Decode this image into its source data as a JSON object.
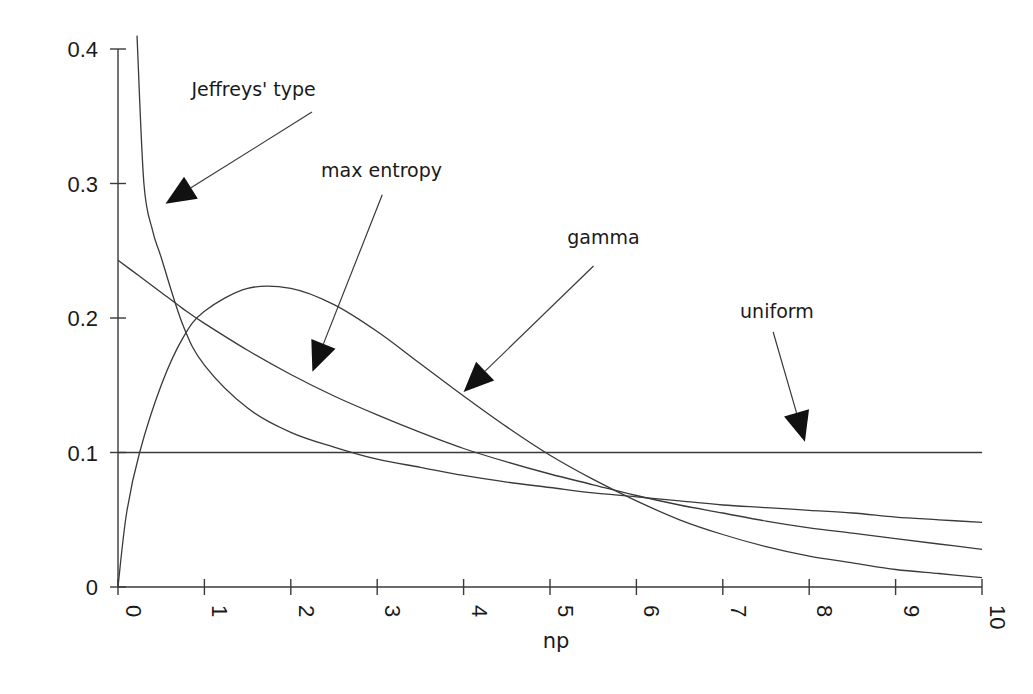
{
  "chart_data": {
    "type": "line",
    "title": "",
    "xlabel": "np",
    "ylabel": "",
    "xlim": [
      0,
      10
    ],
    "ylim": [
      0,
      0.4
    ],
    "grid": false,
    "legend": "none (curves labelled by arrow annotations)",
    "x_ticks": [
      "0",
      "1",
      "2",
      "3",
      "4",
      "5",
      "6",
      "7",
      "8",
      "9",
      "10"
    ],
    "y_ticks": [
      "0",
      "0.1",
      "0.2",
      "0.3",
      "0.4"
    ],
    "x": [
      0,
      0.25,
      0.5,
      0.75,
      1,
      1.5,
      2,
      2.5,
      3,
      3.5,
      4,
      4.5,
      5,
      5.5,
      6,
      6.5,
      7,
      7.5,
      8,
      8.5,
      9,
      9.5,
      10
    ],
    "series": [
      {
        "name": "Jeffreys' type",
        "note": "diverges at np→0; enters plot top (0.4) near np≈0.22",
        "values": [
          null,
          0.36,
          0.245,
          0.195,
          0.165,
          0.133,
          0.115,
          0.104,
          0.095,
          0.089,
          0.083,
          0.078,
          0.074,
          0.07,
          0.067,
          0.064,
          0.061,
          0.059,
          0.057,
          0.055,
          0.052,
          0.05,
          0.048
        ]
      },
      {
        "name": "max entropy",
        "values": [
          0.243,
          0.231,
          0.219,
          0.207,
          0.196,
          0.176,
          0.158,
          0.142,
          0.128,
          0.115,
          0.103,
          0.093,
          0.084,
          0.076,
          0.068,
          0.061,
          0.055,
          0.049,
          0.044,
          0.04,
          0.036,
          0.032,
          0.028
        ]
      },
      {
        "name": "gamma",
        "values": [
          0,
          0.1,
          0.15,
          0.185,
          0.205,
          0.222,
          0.222,
          0.21,
          0.19,
          0.166,
          0.142,
          0.119,
          0.098,
          0.08,
          0.064,
          0.05,
          0.039,
          0.03,
          0.023,
          0.018,
          0.013,
          0.01,
          0.007
        ]
      },
      {
        "name": "uniform",
        "values": [
          0.1,
          0.1,
          0.1,
          0.1,
          0.1,
          0.1,
          0.1,
          0.1,
          0.1,
          0.1,
          0.1,
          0.1,
          0.1,
          0.1,
          0.1,
          0.1,
          0.1,
          0.1,
          0.1,
          0.1,
          0.1,
          0.1,
          0.1
        ]
      }
    ],
    "annotations": [
      {
        "text": "Jeffreys' type",
        "label_xy": [
          0.85,
          0.365
        ],
        "arrow_to": [
          0.55,
          0.285
        ]
      },
      {
        "text": "max entropy",
        "label_xy": [
          2.35,
          0.305
        ],
        "arrow_to": [
          2.25,
          0.16
        ]
      },
      {
        "text": "gamma",
        "label_xy": [
          5.2,
          0.255
        ],
        "arrow_to": [
          4.0,
          0.145
        ]
      },
      {
        "text": "uniform",
        "label_xy": [
          7.2,
          0.2
        ],
        "arrow_to": [
          7.95,
          0.108
        ]
      }
    ]
  },
  "labels": {
    "x_axis_title": "np"
  },
  "style": {
    "line_color": "#3a3a3a",
    "arrow_color": "#111111",
    "background": "#ffffff"
  }
}
